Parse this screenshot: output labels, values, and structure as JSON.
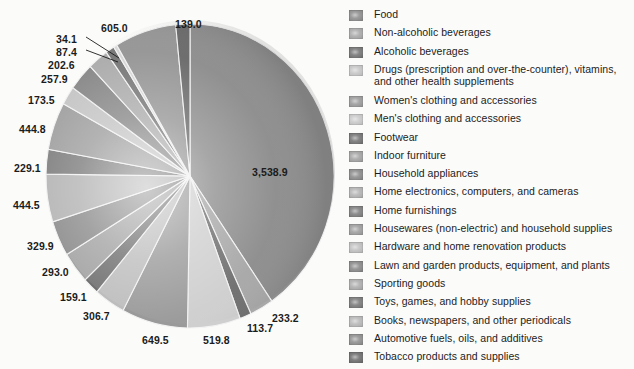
{
  "chart_data": {
    "type": "pie",
    "title": "",
    "subtitle": "",
    "xlabel": "",
    "ylabel": "",
    "legend_position": "right",
    "grid": false,
    "units": "millions of dollars",
    "categories": [
      "Food",
      "Non-alcoholic beverages",
      "Alcoholic beverages",
      "Drugs (prescription and over-the-counter), vitamins,\nand other health supplements",
      "Women's clothing and accessories",
      "Men's clothing and accessories",
      "Footwear",
      "Indoor furniture",
      "Household appliances",
      "Home electronics, computers, and cameras",
      "Home furnishings",
      "Housewares (non-electric) and household supplies",
      "Hardware and home renovation products",
      "Lawn and garden products, equipment, and plants",
      "Sporting goods",
      "Toys, games, and hobby supplies",
      "Books, newspapers, and other periodicals",
      "Automotive fuels, oils, and additives",
      "Tobacco products and supplies"
    ],
    "values": [
      3538.9,
      233.2,
      113.7,
      519.8,
      649.5,
      306.7,
      159.1,
      293.0,
      329.9,
      444.5,
      229.1,
      444.8,
      173.5,
      257.9,
      202.6,
      87.4,
      34.1,
      605.0,
      139.0
    ],
    "value_labels": [
      "3,538.9",
      "233.2",
      "113.7",
      "519.8",
      "649.5",
      "306.7",
      "159.1",
      "293.0",
      "329.9",
      "444.5",
      "229.1",
      "444.8",
      "173.5",
      "257.9",
      "202.6",
      "87.4",
      "34.1",
      "605.0",
      "139.0"
    ],
    "slice_colors": [
      "#8e8e8e",
      "#a8a8a8",
      "#707070",
      "#cfcfcf",
      "#9a9a9a",
      "#bdbdbd",
      "#6f6f6f",
      "#a2a2a2",
      "#8a8a8a",
      "#b2b2b2",
      "#7c7c7c",
      "#9e9e9e",
      "#c4c4c4",
      "#888888",
      "#acacac",
      "#777777",
      "#d6d6d6",
      "#969696",
      "#6b6b6b"
    ]
  },
  "legend": {
    "items": [
      {
        "label": "Food",
        "swatch": "#8e8e8e"
      },
      {
        "label": "Non-alcoholic beverages",
        "swatch": "#a9a9a9"
      },
      {
        "label": "Alcoholic beverages",
        "swatch": "#757575"
      },
      {
        "label": "Drugs (prescription and over-the-counter), vitamins,\nand other health supplements",
        "swatch": "#c6c6c6"
      },
      {
        "label": "Women's clothing and accessories",
        "swatch": "#9b9b9b"
      },
      {
        "label": "Men's clothing and accessories",
        "swatch": "#c9c9c9"
      },
      {
        "label": "Footwear",
        "swatch": "#747474"
      },
      {
        "label": "Indoor furniture",
        "swatch": "#a3a3a3"
      },
      {
        "label": "Household appliances",
        "swatch": "#8b8b8b"
      },
      {
        "label": "Home electronics, computers, and cameras",
        "swatch": "#b3b3b3"
      },
      {
        "label": "Home furnishings",
        "swatch": "#7f7f7f"
      },
      {
        "label": "Housewares (non-electric) and household supplies",
        "swatch": "#9e9e9e"
      },
      {
        "label": "Hardware and home renovation products",
        "swatch": "#c0c0c0"
      },
      {
        "label": "Lawn and garden products, equipment, and plants",
        "swatch": "#898989"
      },
      {
        "label": "Sporting goods",
        "swatch": "#adadad"
      },
      {
        "label": "Toys, games, and hobby supplies",
        "swatch": "#7a7a7a"
      },
      {
        "label": "Books, newspapers, and other periodicals",
        "swatch": "#b8b8b8"
      },
      {
        "label": "Automotive fuels, oils, and additives",
        "swatch": "#8f8f8f"
      },
      {
        "label": "Tobacco products and supplies",
        "swatch": "#6e6e6e"
      }
    ]
  },
  "value_label_positions": [
    {
      "text": "3,538.9",
      "x": 252,
      "y": 166
    },
    {
      "text": "139.0",
      "x": 175,
      "y": 18
    },
    {
      "text": "605.0",
      "x": 101,
      "y": 22
    },
    {
      "text": "34.1",
      "x": 56,
      "y": 33
    },
    {
      "text": "87.4",
      "x": 56,
      "y": 46
    },
    {
      "text": "202.6",
      "x": 48,
      "y": 59
    },
    {
      "text": "257.9",
      "x": 41,
      "y": 73
    },
    {
      "text": "173.5",
      "x": 28,
      "y": 94
    },
    {
      "text": "444.8",
      "x": 19,
      "y": 123
    },
    {
      "text": "229.1",
      "x": 14,
      "y": 162
    },
    {
      "text": "444.5",
      "x": 13,
      "y": 199
    },
    {
      "text": "329.9",
      "x": 27,
      "y": 240
    },
    {
      "text": "293.0",
      "x": 42,
      "y": 266
    },
    {
      "text": "159.1",
      "x": 60,
      "y": 291
    },
    {
      "text": "306.7",
      "x": 83,
      "y": 310
    },
    {
      "text": "649.5",
      "x": 142,
      "y": 334
    },
    {
      "text": "519.8",
      "x": 203,
      "y": 334
    },
    {
      "text": "113.7",
      "x": 247,
      "y": 322
    },
    {
      "text": "233.2",
      "x": 272,
      "y": 312
    }
  ],
  "leader_lines": [
    {
      "x1": 86,
      "y1": 37,
      "x2": 119,
      "y2": 58
    },
    {
      "x1": 86,
      "y1": 50,
      "x2": 118,
      "y2": 62
    }
  ]
}
